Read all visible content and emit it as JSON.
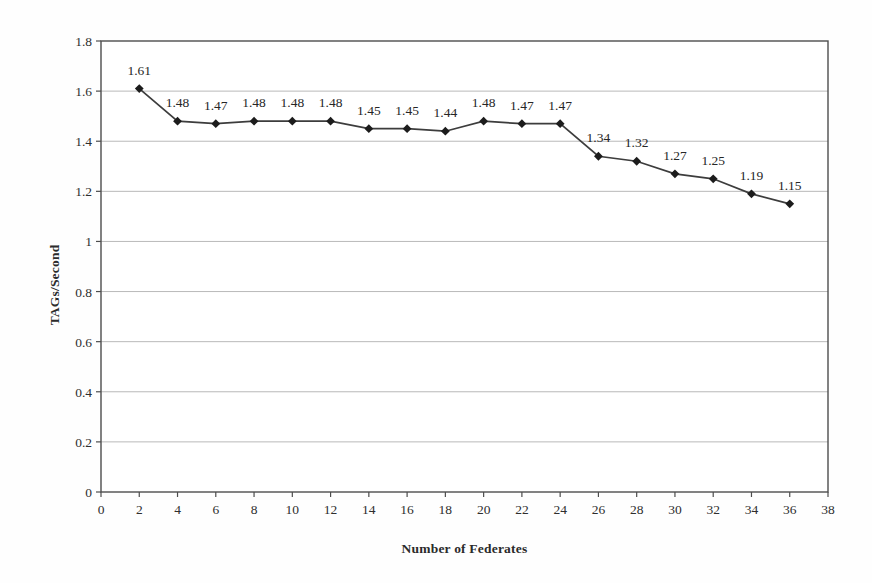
{
  "chart_data": {
    "type": "line",
    "title": "",
    "xlabel": "Number of Federates",
    "ylabel": "TAGs/Second",
    "x": [
      2,
      4,
      6,
      8,
      10,
      12,
      14,
      16,
      18,
      20,
      22,
      24,
      26,
      28,
      30,
      32,
      34,
      36
    ],
    "values": [
      1.61,
      1.48,
      1.47,
      1.48,
      1.48,
      1.48,
      1.45,
      1.45,
      1.44,
      1.48,
      1.47,
      1.47,
      1.34,
      1.32,
      1.27,
      1.25,
      1.19,
      1.15
    ],
    "point_labels": [
      "1.61",
      "1.48",
      "1.47",
      "1.48",
      "1.48",
      "1.48",
      "1.45",
      "1.45",
      "1.44",
      "1.48",
      "1.47",
      "1.47",
      "1.34",
      "1.32",
      "1.27",
      "1.25",
      "1.19",
      "1.15"
    ],
    "xlim": [
      0,
      38
    ],
    "ylim": [
      0,
      1.8
    ],
    "xticks": [
      0,
      2,
      4,
      6,
      8,
      10,
      12,
      14,
      16,
      18,
      20,
      22,
      24,
      26,
      28,
      30,
      32,
      34,
      36,
      38
    ],
    "yticks": [
      0,
      0.2,
      0.4,
      0.6,
      0.8,
      1,
      1.2,
      1.4,
      1.6,
      1.8
    ],
    "ytick_labels": [
      "0",
      "0.2",
      "0.4",
      "0.6",
      "0.8",
      "1",
      "1.2",
      "1.4",
      "1.6",
      "1.8"
    ],
    "grid": "horizontal-only",
    "legend": "none",
    "marker": "diamond",
    "line_color": "#3d3d3d",
    "marker_color": "#1c1c1c",
    "gridline_color": "#b9b9b9",
    "axis_color": "#4d4d4d",
    "text_color": "#2e2e2e",
    "plot_background": "#ffffff"
  }
}
